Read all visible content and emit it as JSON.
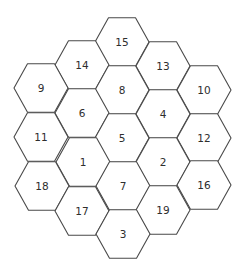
{
  "diagram": {
    "type": "hexagonal-grid",
    "orientation": "flat-topped",
    "hex_radius": 27,
    "hex_half_height": 24.3,
    "stroke_color": "#4a4a4a",
    "text_color": "#2e2e2e",
    "cells": [
      {
        "label": "15",
        "cx": 122,
        "cy": 42
      },
      {
        "label": "14",
        "cx": 82,
        "cy": 65
      },
      {
        "label": "13",
        "cx": 163,
        "cy": 66
      },
      {
        "label": "9",
        "cx": 41,
        "cy": 88
      },
      {
        "label": "8",
        "cx": 122,
        "cy": 90
      },
      {
        "label": "10",
        "cx": 204,
        "cy": 90
      },
      {
        "label": "6",
        "cx": 82,
        "cy": 113
      },
      {
        "label": "4",
        "cx": 163,
        "cy": 114
      },
      {
        "label": "11",
        "cx": 41,
        "cy": 137
      },
      {
        "label": "5",
        "cx": 122,
        "cy": 138
      },
      {
        "label": "12",
        "cx": 204,
        "cy": 138
      },
      {
        "label": "1",
        "cx": 83,
        "cy": 162
      },
      {
        "label": "2",
        "cx": 163,
        "cy": 162
      },
      {
        "label": "18",
        "cx": 42,
        "cy": 186
      },
      {
        "label": "7",
        "cx": 123,
        "cy": 186
      },
      {
        "label": "16",
        "cx": 204,
        "cy": 185
      },
      {
        "label": "17",
        "cx": 82,
        "cy": 211
      },
      {
        "label": "19",
        "cx": 163,
        "cy": 210
      },
      {
        "label": "3",
        "cx": 123,
        "cy": 234
      }
    ]
  }
}
